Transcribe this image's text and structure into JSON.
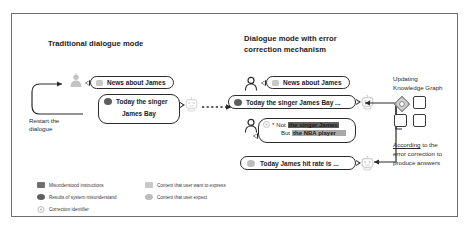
{
  "figure": {
    "left_panel": {
      "title": "Traditional dialogue mode",
      "restart_label_line1": "Restart the",
      "restart_label_line2": "dialogue",
      "user_bubble": "News about James",
      "bot_bubble_line1": "Today the singer",
      "bot_bubble_line2": "James Bay",
      "user_icon": "person-icon",
      "bot_icon": "robot-icon"
    },
    "right_panel": {
      "title_line1": "Dialogue mode with error",
      "title_line2": "correction mechanism",
      "user_bubble": "News about James",
      "bot_bubble": "Today the singer James Bay ...",
      "correction_bubble": {
        "marker": "*",
        "line1_prefix": "Not",
        "line1_highlight": "the singer James",
        "line2_prefix": "But",
        "line2_highlight": "the NBA player"
      },
      "answer_bubble": "Today James hit rate is ...",
      "user_icon": "person-icon",
      "bot_icon": "robot-icon",
      "correction_icon": "correction-identifier-icon"
    },
    "knowledge_graph": {
      "title_line1": "Updating",
      "title_line2": "Knowledge Graph",
      "caption_line1_underlined": "According",
      "caption_line1_rest": " to the",
      "caption_line2": "error correction to",
      "caption_line3": "produce answers",
      "node_count": 4,
      "active_node_icon": "highlighted-node-icon"
    },
    "legend": {
      "items": [
        {
          "label": "Misunderstood instructions",
          "swatch": "square",
          "color": "#6f6f6f"
        },
        {
          "label": "Results of system misunderstand",
          "swatch": "circle",
          "color": "#5e5e5e"
        },
        {
          "label": "Correction identifier",
          "swatch": "marker",
          "color": "#b9b9b9"
        },
        {
          "label": "Content that user want to express",
          "swatch": "square",
          "color": "#c8c8c8"
        },
        {
          "label": "Content that user expect",
          "swatch": "circle",
          "color": "#bdbdbd"
        }
      ]
    },
    "colors": {
      "frame_border": "#6f6f6f",
      "bubble_border": "#2b2b2b",
      "text": "#1b1b1b",
      "dark_swatch": "#6f6f6f",
      "mid_swatch": "#5e5e5e",
      "light_swatch": "#c8c8c8",
      "highlight_dark": "#5e5e5e",
      "highlight_light": "#a8a8a8"
    }
  }
}
